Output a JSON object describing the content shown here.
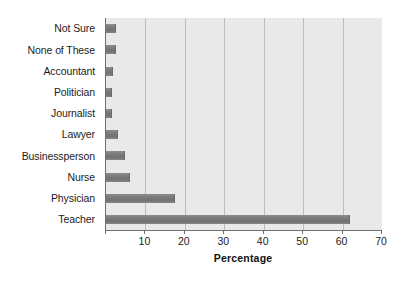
{
  "chart_data": {
    "type": "bar",
    "orientation": "horizontal",
    "title": "",
    "xlabel": "Percentage",
    "ylabel": "",
    "xlim": [
      0,
      70
    ],
    "xticks": [
      0,
      10,
      20,
      30,
      40,
      50,
      60,
      70
    ],
    "xtick_labels": [
      "",
      "10",
      "20",
      "30",
      "40",
      "50",
      "60",
      "70"
    ],
    "grid": "vertical",
    "legend": "none",
    "categories": [
      "Not Sure",
      "None of These",
      "Accountant",
      "Politician",
      "Journalist",
      "Lawyer",
      "Businessperson",
      "Nurse",
      "Physician",
      "Teacher"
    ],
    "values": [
      2.5,
      2.6,
      1.8,
      1.5,
      1.4,
      3.0,
      4.9,
      6.1,
      17.5,
      62.0
    ],
    "series": [
      {
        "name": "Percentage",
        "values": [
          2.5,
          2.6,
          1.8,
          1.5,
          1.4,
          3.0,
          4.9,
          6.1,
          17.5,
          62.0
        ]
      }
    ]
  },
  "colors": {
    "plot_background": "#e9e9e9",
    "bar_fill": "#7b7b7b",
    "gridline": "#bdbdbd",
    "axis_line": "#6f6f6f",
    "text": "#1c1c1c",
    "page_background": "#ffffff"
  }
}
